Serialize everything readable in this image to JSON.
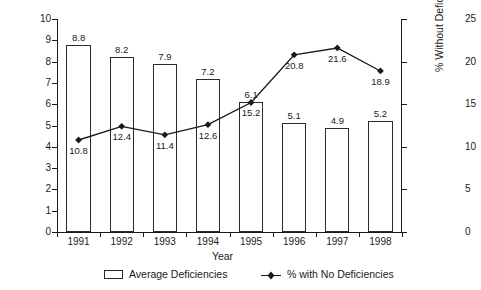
{
  "chart_data": {
    "type": "bar",
    "title": "",
    "xlabel": "Year",
    "ylabel": "Avg. Number Per Facility",
    "y2label": "% Without Deficiency",
    "categories": [
      "1991",
      "1992",
      "1993",
      "1994",
      "1995",
      "1996",
      "1997",
      "1998"
    ],
    "ylim": [
      0,
      10
    ],
    "y2lim": [
      0,
      25
    ],
    "yticks": [
      "0",
      "1",
      "2",
      "3",
      "4",
      "5",
      "6",
      "7",
      "8",
      "9",
      "10"
    ],
    "y2ticks": [
      "0",
      "5",
      "10",
      "15",
      "20",
      "25"
    ],
    "grid": false,
    "legend_position": "bottom",
    "series": [
      {
        "name": "Average Deficiencies",
        "type": "bar",
        "axis": "left",
        "values": [
          8.8,
          8.2,
          7.9,
          7.2,
          6.1,
          5.1,
          4.9,
          5.2
        ],
        "labels": [
          "8.8",
          "8.2",
          "7.9",
          "7.2",
          "6.1",
          "5.1",
          "4.9",
          "5.2"
        ],
        "fill": "#ffffff",
        "edge": "#2a2a2a"
      },
      {
        "name": "% with No Deficiencies",
        "type": "line",
        "axis": "right",
        "values": [
          10.8,
          12.4,
          11.4,
          12.6,
          15.2,
          20.8,
          21.6,
          18.9
        ],
        "labels": [
          "10.8",
          "12.4",
          "11.4",
          "12.6",
          "15.2",
          "20.8",
          "21.6",
          "18.9"
        ],
        "color": "#1a1a1a",
        "marker": "diamond"
      }
    ]
  },
  "legend": {
    "bars_label": "Average Deficiencies",
    "line_label": "% with No Deficiencies"
  }
}
